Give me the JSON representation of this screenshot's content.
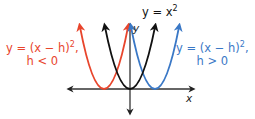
{
  "diagram": {
    "axes": {
      "x_label": "x",
      "y_label": "y"
    },
    "curves": [
      {
        "id": "parent",
        "equation_line1": "y = x",
        "exponent": "2",
        "line2": "",
        "color": "#111111",
        "vertex_shift": 0
      },
      {
        "id": "shift-left",
        "equation_line1": "y = (x − h)",
        "exponent": "2",
        "equation_suffix": ",",
        "line2": "h < 0",
        "color": "#e8452c",
        "vertex_shift": -1
      },
      {
        "id": "shift-right",
        "equation_line1": "y = (x − h)",
        "exponent": "2",
        "equation_suffix": ",",
        "line2": "h > 0",
        "color": "#3a78c6",
        "vertex_shift": 1
      }
    ]
  }
}
